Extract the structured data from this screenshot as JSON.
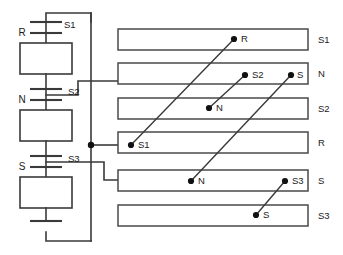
{
  "diagram": {
    "stroke_color": "#3a3a3a",
    "bar_stroke_color": "#4a4a4a",
    "node_color": "#111111",
    "background": "#ffffff",
    "left_circuit": {
      "phase_labels": [
        {
          "text": "R",
          "x": 22,
          "y": 33
        },
        {
          "text": "N",
          "x": 22,
          "y": 100
        },
        {
          "text": "S",
          "x": 22,
          "y": 167
        }
      ],
      "switch_labels": [
        {
          "text": "S1",
          "x": 64,
          "y": 25
        },
        {
          "text": "S2",
          "x": 68,
          "y": 92
        },
        {
          "text": "S3",
          "x": 68,
          "y": 159
        }
      ],
      "blocks": [
        {
          "x": 20,
          "y": 43,
          "w": 52,
          "h": 31
        },
        {
          "x": 20,
          "y": 110,
          "w": 52,
          "h": 31
        },
        {
          "x": 20,
          "y": 177,
          "w": 52,
          "h": 31
        }
      ]
    },
    "bus_bars": [
      {
        "label": "S1",
        "terminals": [
          {
            "text": "R",
            "x": 234,
            "y": 39
          }
        ]
      },
      {
        "label": "N",
        "terminals": [
          {
            "text": "S2",
            "x": 245,
            "y": 75
          },
          {
            "text": "S",
            "x": 291,
            "y": 75
          }
        ]
      },
      {
        "label": "S2",
        "terminals": [
          {
            "text": "N",
            "x": 209,
            "y": 108
          }
        ]
      },
      {
        "label": "R",
        "terminals": [
          {
            "text": "S1",
            "x": 131,
            "y": 145
          }
        ]
      },
      {
        "label": "S",
        "terminals": [
          {
            "text": "N",
            "x": 191,
            "y": 181
          },
          {
            "text": "S3",
            "x": 285,
            "y": 181
          }
        ]
      },
      {
        "label": "S3",
        "terminals": [
          {
            "text": "S",
            "x": 256,
            "y": 215
          }
        ]
      }
    ],
    "connections": [
      {
        "from": "S1",
        "to": "R",
        "x1": 131,
        "y1": 145,
        "x2": 234,
        "y2": 39
      },
      {
        "from": "N",
        "to": "S2",
        "x1": 209,
        "y1": 108,
        "x2": 245,
        "y2": 75
      },
      {
        "from": "N",
        "to": "S",
        "x1": 191,
        "y1": 181,
        "x2": 291,
        "y2": 75
      },
      {
        "from": "S",
        "to": "S3",
        "x1": 256,
        "y1": 215,
        "x2": 285,
        "y2": 181
      }
    ]
  }
}
